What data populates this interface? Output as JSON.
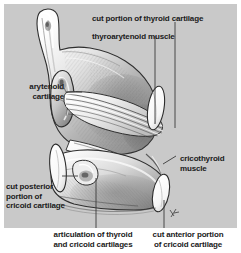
{
  "figure": {
    "background_color": "#c9c9c9",
    "ink_color": "#1a1a1a",
    "leader_color": "#3a3a3a",
    "signature": "artist-monogram"
  },
  "labels": {
    "cut_thyroid": "cut portion of thyroid cartilage",
    "thyroarytenoid": "thyroarytenoid muscle",
    "arytenoid": "arytenoid\ncartilage",
    "cricothyroid": "cricothyroid\nmuscle",
    "cut_posterior_cricoid": "cut posterior\nportion of\ncricoid cartilage"
  },
  "captions": {
    "articulation": "articulation of thyroid\nand cricoid cartilages",
    "cut_anterior_cricoid": "cut anterior portion\nof cricoid cartilage"
  }
}
